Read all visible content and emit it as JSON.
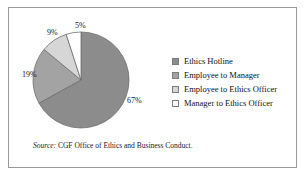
{
  "chart_data": {
    "type": "pie",
    "title": "",
    "subtitle": "",
    "xlabel": "",
    "ylabel": "",
    "legend_position": "right",
    "grid": false,
    "categories": [
      "Ethics Hotline",
      "Employee to Manager",
      "Employee to Ethics Officer",
      "Manager to Ethics Officer"
    ],
    "values": [
      67,
      19,
      9,
      5
    ],
    "value_unit": "%",
    "data_labels": [
      "67%",
      "19%",
      "9%",
      "5%"
    ],
    "colors": [
      "#8c8c8c",
      "#a3a3a3",
      "#d6d6d6",
      "#ffffff"
    ],
    "start_angle_deg": 0,
    "direction": "clockwise"
  },
  "legend": {
    "items": [
      {
        "label": "Ethics Hotline",
        "color": "#8c8c8c"
      },
      {
        "label": "Employee to Manager",
        "color": "#a3a3a3"
      },
      {
        "label": "Employee to Ethics Officer",
        "color": "#d6d6d6"
      },
      {
        "label": "Manager to Ethics Officer",
        "color": "#ffffff"
      }
    ]
  },
  "source": {
    "label": "Source:",
    "text": "CGF Office of Ethics and Business Conduct.",
    "full": "Source: CGF Office of Ethics and Business Conduct."
  },
  "style": {
    "border_color": "#9a9a9a",
    "background": "#ffffff",
    "label_color": "#1a1a1a",
    "slice_outline": "#6f6f6f"
  }
}
